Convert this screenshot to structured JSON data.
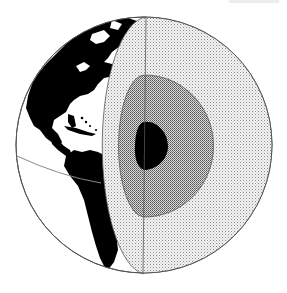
{
  "figure": {
    "title": "Cutaway globe showing Earth's interior layers",
    "cropped_label_visible": true,
    "layers": [
      {
        "id": "crust-surface",
        "label": "Surface (continents)",
        "fill": "#000000"
      },
      {
        "id": "mantle",
        "label": "Mantle",
        "pattern": "fine-stipple",
        "fill": "#e9e9e9"
      },
      {
        "id": "outer-core",
        "label": "Outer core",
        "pattern": "dense-stipple",
        "fill": "#bdbdbd"
      },
      {
        "id": "inner-core",
        "label": "Inner core",
        "fill": "#000000"
      }
    ],
    "surface_features": [
      "north-america",
      "south-america",
      "caribbean-islands",
      "equator-line"
    ],
    "colors": {
      "background": "#ffffff",
      "outline": "#555555",
      "land": "#000000",
      "ocean": "#ffffff"
    }
  }
}
